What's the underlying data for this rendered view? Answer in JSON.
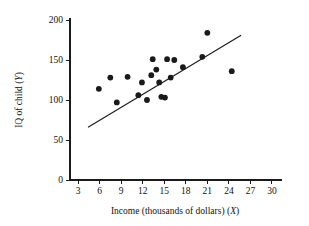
{
  "chart_data": {
    "type": "scatter",
    "title": "",
    "subtitle": "",
    "xlabel": "Income (thousands of dollars) (X)",
    "xlabel_main": "Income (thousands of dollars) (",
    "xlabel_var": "X",
    "xlabel_tail": ")",
    "ylabel": "IQ of child (Y)",
    "ylabel_main": "IQ of child (",
    "ylabel_var": "Y",
    "ylabel_tail": ")",
    "xlim": [
      1.2,
      31.5
    ],
    "ylim": [
      0,
      215
    ],
    "xticks": [
      3,
      6,
      9,
      12,
      15,
      18,
      21,
      24,
      27,
      30
    ],
    "yticks": [
      0,
      50,
      100,
      150,
      200
    ],
    "xtick_labels": [
      "3",
      "6",
      "9",
      "12",
      "15",
      "18",
      "21",
      "24",
      "27",
      "30"
    ],
    "ytick_labels": [
      "0",
      "50",
      "100",
      "150",
      "200"
    ],
    "grid": false,
    "legend": "none",
    "series": [
      {
        "name": "IQ of child vs family income",
        "marker": "filled-circle",
        "color": "#1a1a1a",
        "points": [
          {
            "x": 5.9,
            "y": 114
          },
          {
            "x": 7.5,
            "y": 128
          },
          {
            "x": 8.4,
            "y": 97
          },
          {
            "x": 9.9,
            "y": 129
          },
          {
            "x": 11.4,
            "y": 106
          },
          {
            "x": 11.9,
            "y": 122
          },
          {
            "x": 12.6,
            "y": 100
          },
          {
            "x": 13.2,
            "y": 131
          },
          {
            "x": 13.4,
            "y": 151
          },
          {
            "x": 13.9,
            "y": 138
          },
          {
            "x": 14.3,
            "y": 122
          },
          {
            "x": 14.6,
            "y": 104
          },
          {
            "x": 15.1,
            "y": 103
          },
          {
            "x": 15.4,
            "y": 151
          },
          {
            "x": 15.9,
            "y": 128
          },
          {
            "x": 16.4,
            "y": 150
          },
          {
            "x": 17.6,
            "y": 141
          },
          {
            "x": 20.3,
            "y": 154
          },
          {
            "x": 21.0,
            "y": 184
          },
          {
            "x": 24.4,
            "y": 136
          }
        ]
      }
    ],
    "trend_line": {
      "name": "regression-line",
      "color": "#1a1a1a",
      "x_start": 4.4,
      "y_start": 66,
      "x_end": 25.7,
      "y_end": 181
    }
  }
}
